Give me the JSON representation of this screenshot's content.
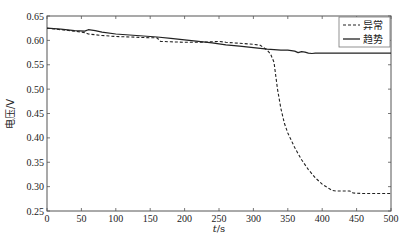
{
  "chart_data": {
    "type": "line",
    "title": "",
    "xlabel": "t/s",
    "ylabel": "电压/V",
    "xlim": [
      0,
      500
    ],
    "ylim": [
      0.25,
      0.65
    ],
    "xticks": [
      0,
      50,
      100,
      150,
      200,
      250,
      300,
      350,
      400,
      450,
      500
    ],
    "yticks": [
      0.25,
      0.3,
      0.35,
      0.4,
      0.45,
      0.5,
      0.55,
      0.6,
      0.65
    ],
    "ytick_labels": [
      "0.25",
      "0.30",
      "0.35",
      "0.40",
      "0.45",
      "0.50",
      "0.55",
      "0.60",
      "0.65"
    ],
    "grid": false,
    "legend_position": "upper right",
    "series": [
      {
        "name": "异常",
        "style": "dashed",
        "color": "#222222",
        "x": [
          0,
          20,
          40,
          55,
          60,
          80,
          100,
          120,
          140,
          160,
          165,
          180,
          200,
          220,
          240,
          250,
          260,
          280,
          300,
          310,
          320,
          325,
          330,
          335,
          340,
          345,
          350,
          360,
          370,
          380,
          390,
          400,
          410,
          415,
          420,
          440,
          445,
          460,
          480,
          500
        ],
        "y": [
          0.625,
          0.622,
          0.619,
          0.616,
          0.613,
          0.61,
          0.608,
          0.607,
          0.606,
          0.605,
          0.598,
          0.597,
          0.596,
          0.596,
          0.597,
          0.598,
          0.596,
          0.594,
          0.592,
          0.59,
          0.58,
          0.572,
          0.555,
          0.5,
          0.46,
          0.43,
          0.41,
          0.38,
          0.355,
          0.335,
          0.318,
          0.305,
          0.296,
          0.292,
          0.291,
          0.291,
          0.287,
          0.286,
          0.286,
          0.286
        ]
      },
      {
        "name": "趋势",
        "style": "solid",
        "color": "#222222",
        "x": [
          0,
          20,
          40,
          55,
          60,
          70,
          80,
          100,
          120,
          140,
          160,
          180,
          200,
          220,
          240,
          260,
          280,
          300,
          320,
          340,
          350,
          360,
          365,
          370,
          375,
          380,
          385,
          390,
          400,
          420,
          450,
          480,
          500
        ],
        "y": [
          0.625,
          0.623,
          0.62,
          0.619,
          0.622,
          0.62,
          0.617,
          0.613,
          0.611,
          0.609,
          0.607,
          0.604,
          0.601,
          0.598,
          0.595,
          0.591,
          0.588,
          0.585,
          0.582,
          0.58,
          0.58,
          0.578,
          0.575,
          0.577,
          0.576,
          0.574,
          0.573,
          0.574,
          0.574,
          0.574,
          0.574,
          0.574,
          0.574
        ]
      }
    ]
  },
  "legend": {
    "items": [
      {
        "label": "异常",
        "style": "dashed"
      },
      {
        "label": "趋势",
        "style": "solid"
      }
    ]
  },
  "axes": {
    "xlabel_italic": "t",
    "xlabel_unit": "/s",
    "ylabel": "电压/V"
  }
}
